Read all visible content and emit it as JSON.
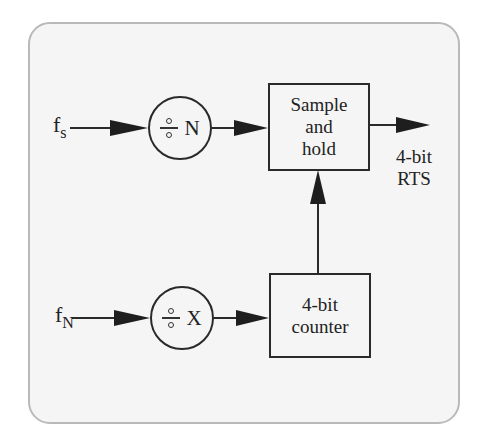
{
  "diagram": {
    "inputs": {
      "fs": {
        "base": "f",
        "subscript": "s"
      },
      "fn": {
        "base": "f",
        "subscript": "N"
      }
    },
    "dividers": {
      "n": {
        "symbol": "÷",
        "divisor": "N"
      },
      "x": {
        "symbol": "÷",
        "divisor": "X"
      }
    },
    "blocks": {
      "sample_hold": {
        "line1": "Sample",
        "line2": "and",
        "line3": "hold"
      },
      "counter": {
        "line1": "4-bit",
        "line2": "counter"
      }
    },
    "output": {
      "line1": "4-bit",
      "line2": "RTS"
    },
    "colors": {
      "stroke": "#2a2a2a",
      "frame_border": "#b9b9b9",
      "frame_fill": "#f5f5f5"
    }
  }
}
